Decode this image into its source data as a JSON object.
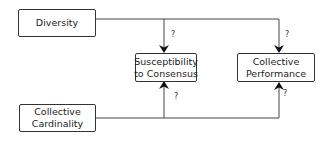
{
  "diagram": {
    "nodes": {
      "diversity": {
        "label": "Diversity"
      },
      "susceptibility": {
        "label_line1": "Susceptibility",
        "label_line2": "to Consensus"
      },
      "performance": {
        "label_line1": "Collective",
        "label_line2": "Performance"
      },
      "cardinality": {
        "label_line1": "Collective",
        "label_line2": "Cardinality"
      }
    },
    "edges": [
      {
        "from": "Diversity",
        "to": "Susceptibility to Consensus",
        "label": "?"
      },
      {
        "from": "Diversity",
        "to": "Collective Performance",
        "label": "?"
      },
      {
        "from": "Collective Cardinality",
        "to": "Susceptibility to Consensus",
        "label": "?"
      },
      {
        "from": "Collective Cardinality",
        "to": "Collective Performance",
        "label": "?"
      }
    ]
  }
}
